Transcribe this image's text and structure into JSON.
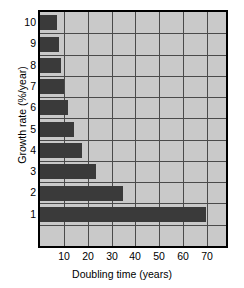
{
  "chart_data": {
    "type": "bar",
    "orientation": "horizontal",
    "title": "",
    "xlabel": "Doubling time (years)",
    "ylabel": "Growth rate (%/year)",
    "categories": [
      "1",
      "2",
      "3",
      "4",
      "5",
      "6",
      "7",
      "8",
      "9",
      "10"
    ],
    "values": [
      69.7,
      35.0,
      23.4,
      17.7,
      14.2,
      11.9,
      10.2,
      9.0,
      8.0,
      7.3
    ],
    "series": [
      {
        "name": "Doubling time",
        "values": [
          69.7,
          35.0,
          23.4,
          17.7,
          14.2,
          11.9,
          10.2,
          9.0,
          8.0,
          7.3
        ]
      }
    ],
    "xlim": [
      0,
      78
    ],
    "ylim_categories": 11,
    "xticks": [
      10,
      20,
      30,
      40,
      50,
      60,
      70
    ],
    "xtick_labels": [
      "10",
      "20",
      "30",
      "40",
      "50",
      "60",
      "70"
    ],
    "ytick_labels": [
      "10",
      "9",
      "8",
      "7",
      "6",
      "5",
      "4",
      "3",
      "2",
      "1"
    ],
    "grid": true,
    "grid_axis": "both",
    "legend": "none",
    "colors": {
      "bar": "#3a3a3a",
      "plot_background": "#c9c9c9",
      "grid": "#4a4a4a",
      "frame": "#000000",
      "figure_background": "#ffffff",
      "text": "#000000"
    }
  },
  "axes": {
    "x_title": "Doubling time (years)",
    "y_title": "Growth rate (%/year)"
  }
}
